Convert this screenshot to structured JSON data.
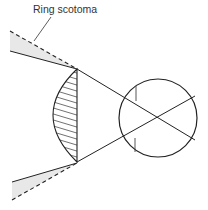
{
  "diagram": {
    "annotation": {
      "text": "Ring scotoma",
      "x": 33,
      "y": 13,
      "leader": {
        "x1": 51,
        "y1": 17,
        "x2": 34,
        "y2": 41
      }
    },
    "colors": {
      "stroke": "#222222",
      "scotoma_fill": "#e6e6e6",
      "background": "#ffffff"
    },
    "lens": {
      "top": {
        "x": 77,
        "y": 69
      },
      "bottom": {
        "x": 77,
        "y": 162
      },
      "bulge_x": 53,
      "hatched": true
    },
    "eye": {
      "cx": 158,
      "cy": 118,
      "r": 39
    },
    "rays": {
      "top_solid_start": {
        "x": 10,
        "y": 51
      },
      "top_dashed_start": {
        "x": 10,
        "y": 31
      },
      "bottom_solid_start": {
        "x": 12,
        "y": 182
      },
      "bottom_dashed_start": {
        "x": 12,
        "y": 200
      }
    }
  }
}
